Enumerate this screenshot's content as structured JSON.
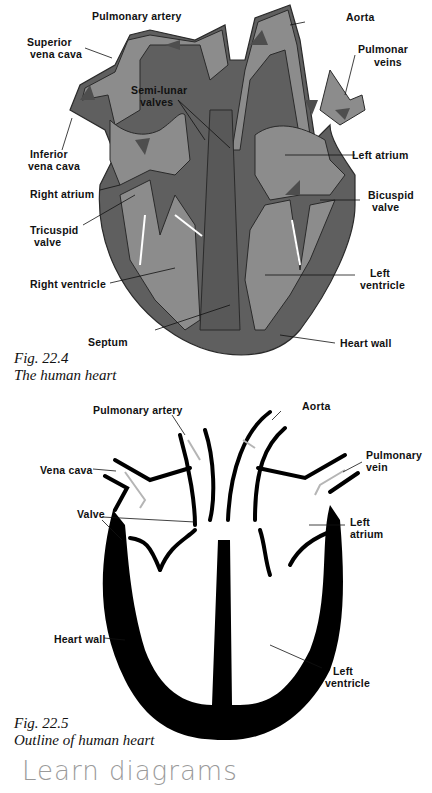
{
  "figure1": {
    "caption_number": "Fig. 22.4",
    "caption_title": "The human heart",
    "labels": {
      "pulmonary_artery": "Pulmonary artery",
      "superior_vena_cava_1": "Superior",
      "superior_vena_cava_2": "vena cava",
      "aorta": "Aorta",
      "pulmonary_veins_1": "Pulmonar",
      "pulmonary_veins_2": "veins",
      "semi_lunar_1": "Semi-lunar",
      "semi_lunar_2": "valves",
      "inferior_vena_cava_1": "Inferior",
      "inferior_vena_cava_2": "vena cava",
      "left_atrium": "Left atrium",
      "right_atrium": "Right atrium",
      "bicuspid_1": "Bicuspid",
      "bicuspid_2": "valve",
      "tricuspid_1": "Tricuspid",
      "tricuspid_2": "valve",
      "right_ventricle": "Right ventricle",
      "left_ventricle_1": "Left",
      "left_ventricle_2": "ventricle",
      "septum": "Septum",
      "heart_wall": "Heart wall"
    },
    "colors": {
      "wall": "#5f5f5f",
      "chamber": "#8c8c8c",
      "outline": "#2a2a2a",
      "arrow": "#4e4e4e"
    }
  },
  "figure2": {
    "caption_number": "Fig. 22.5",
    "caption_title": "Outline of human heart",
    "labels": {
      "pulmonary_artery": "Pulmonary artery",
      "aorta": "Aorta",
      "vena_cava": "Vena cava",
      "pulmonary_vein_1": "Pulmonary",
      "pulmonary_vein_2": "vein",
      "valve": "Valve",
      "left_atrium_1": "Left",
      "left_atrium_2": "atrium",
      "heart_wall": "Heart wall",
      "left_ventricle_1": "Left",
      "left_ventricle_2": "ventricle"
    },
    "colors": {
      "wall": "#000000",
      "arrow": "#b5b5b5"
    }
  },
  "handwritten_note": "Learn diagrams"
}
